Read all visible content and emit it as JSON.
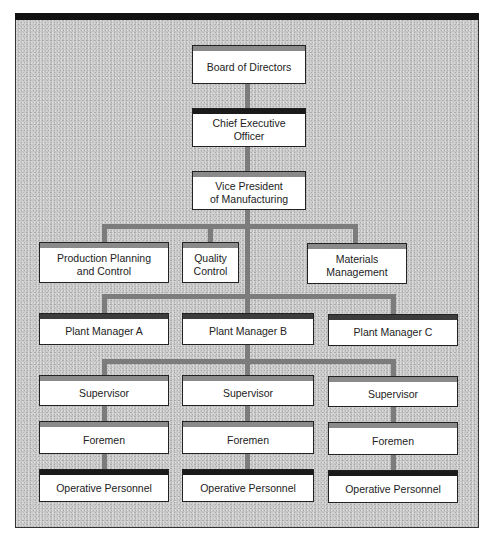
{
  "chart": {
    "title": "",
    "levels": {
      "board": {
        "label": "Board of Directors"
      },
      "ceo": {
        "label": "Chief Executive\nOfficer"
      },
      "vp": {
        "label": "Vice President\nof Manufacturing"
      },
      "staff": [
        {
          "label": "Production Planning\nand Control"
        },
        {
          "label": "Quality\nControl"
        },
        {
          "label": "Materials\nManagement"
        }
      ],
      "plant_managers": [
        {
          "label": "Plant Manager A"
        },
        {
          "label": "Plant Manager B"
        },
        {
          "label": "Plant Manager C"
        }
      ],
      "supervisors": [
        {
          "label": "Supervisor"
        },
        {
          "label": "Supervisor"
        },
        {
          "label": "Supervisor"
        }
      ],
      "foremen": [
        {
          "label": "Foremen"
        },
        {
          "label": "Foremen"
        },
        {
          "label": "Foremen"
        }
      ],
      "operatives": [
        {
          "label": "Operative Personnel"
        },
        {
          "label": "Operative Personnel"
        },
        {
          "label": "Operative Personnel"
        }
      ]
    }
  },
  "colors": {
    "background": "#c9c9c9",
    "connector": "#7c7c7c",
    "header_gray": "#8a8a8a",
    "header_black": "#1a1a1a",
    "box_fill": "#ffffff"
  }
}
